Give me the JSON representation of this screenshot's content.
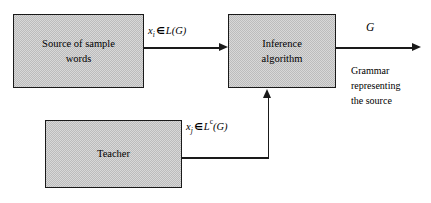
{
  "diagram": {
    "background_color": "#ffffff",
    "line_color": "#1a1a1a",
    "box_fill_color": "#c9c9c9",
    "boxes": [
      {
        "id": "source",
        "lines": [
          "Source of sample",
          "words"
        ]
      },
      {
        "id": "inference",
        "lines": [
          "Inference",
          "algorithm"
        ]
      },
      {
        "id": "teacher",
        "lines": [
          "Teacher"
        ]
      }
    ],
    "labels": {
      "positive_samples": {
        "variable": "x",
        "subscript": "i",
        "operator": "∈",
        "set": "L(G)",
        "superscript": ""
      },
      "negative_samples": {
        "variable": "x",
        "subscript": "j",
        "operator": "∈",
        "set_prefix": "L",
        "superscript": "c",
        "set_suffix": "(G)"
      },
      "output_symbol": "G",
      "output_caption": [
        "Grammar",
        "representing",
        "the source"
      ]
    }
  }
}
